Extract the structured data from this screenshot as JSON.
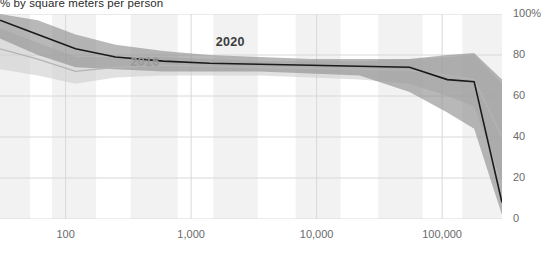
{
  "chart_data": {
    "type": "area",
    "title": "% by square meters per person",
    "xlabel": "",
    "ylabel": "",
    "xscale": "log",
    "xlim": [
      30,
      300000
    ],
    "ylim": [
      0,
      100
    ],
    "grid": true,
    "legend_position": "inline-annotation",
    "x_ticks": [
      {
        "value": 100,
        "label": "100"
      },
      {
        "value": 1000,
        "label": "1,000"
      },
      {
        "value": 10000,
        "label": "10,000"
      },
      {
        "value": 100000,
        "label": "100,000"
      }
    ],
    "y_ticks": [
      {
        "value": 0,
        "label": "0"
      },
      {
        "value": 20,
        "label": "20"
      },
      {
        "value": 40,
        "label": "40"
      },
      {
        "value": 60,
        "label": "60"
      },
      {
        "value": 80,
        "label": "80"
      },
      {
        "value": 100,
        "label": "100%"
      }
    ],
    "annotations": [
      {
        "text": "2020",
        "x": 430,
        "y": 100,
        "color": "#3c3c3c"
      },
      {
        "text": "2016",
        "x": 260,
        "y": 200,
        "color": "#9a9a9a"
      }
    ],
    "series": [
      {
        "name": "2020",
        "color": "#1a1a1a",
        "band_color": "#8c8c8c",
        "x": [
          30,
          60,
          120,
          250,
          600,
          1400,
          3500,
          9000,
          22000,
          55000,
          110000,
          180000,
          300000
        ],
        "values": [
          97,
          90,
          83,
          79,
          77,
          76,
          75.5,
          75,
          74.5,
          74,
          68,
          67,
          8
        ],
        "band_low": [
          88,
          80,
          74,
          73,
          72,
          72,
          72,
          71,
          70,
          62,
          52,
          44,
          2
        ],
        "band_high": [
          100,
          97,
          90,
          85,
          82,
          80,
          79,
          78,
          78,
          78,
          80,
          81,
          68
        ]
      },
      {
        "name": "2016",
        "color": "#b4b4b4",
        "band_color": "#cfcfcf",
        "x": [
          30,
          60,
          120,
          250,
          600,
          1400,
          3500,
          9000,
          22000,
          55000,
          110000,
          180000,
          300000
        ],
        "values": [
          83,
          78,
          72,
          74,
          75,
          74.5,
          74,
          73.5,
          73,
          72.5,
          70,
          68,
          40
        ],
        "band_low": [
          73,
          70,
          66,
          69,
          70,
          70,
          70,
          69,
          68,
          66,
          60,
          55,
          18
        ],
        "band_high": [
          93,
          86,
          79,
          79,
          79,
          78,
          77,
          77,
          77,
          78,
          79,
          80,
          66
        ]
      }
    ],
    "shaded_bands": [
      {
        "x_start": 30,
        "x_end": 52
      },
      {
        "x_start": 78,
        "x_end": 175
      },
      {
        "x_start": 330,
        "x_end": 780
      },
      {
        "x_start": 1500,
        "x_end": 3400
      },
      {
        "x_start": 6800,
        "x_end": 15500
      },
      {
        "x_start": 31000,
        "x_end": 70000
      },
      {
        "x_start": 145000,
        "x_end": 300000
      }
    ]
  }
}
